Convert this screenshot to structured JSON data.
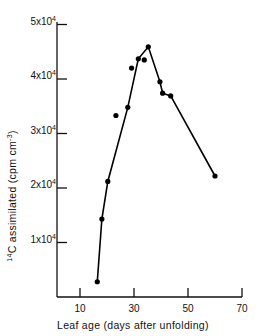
{
  "chart_data": {
    "type": "line",
    "title": "",
    "xlabel": "Leaf age (days after unfolding)",
    "ylabel_prefix": "14",
    "ylabel_main": "C assimilated (cpm cm",
    "ylabel_exp": "-3",
    "ylabel_suffix": ")",
    "ylabel": "14C assimilated (cpm cm-3)",
    "xlim": [
      3,
      70
    ],
    "ylim": [
      0,
      50000
    ],
    "grid": false,
    "legend": null,
    "x_ticks": [
      10,
      30,
      50,
      70
    ],
    "x_tick_labels": [
      "10",
      "30",
      "50",
      "70"
    ],
    "y_ticks": [
      10000,
      20000,
      30000,
      40000,
      50000
    ],
    "y_tick_labels": [
      {
        "mant": "1x10",
        "exp": "4"
      },
      {
        "mant": "2x10",
        "exp": "4"
      },
      {
        "mant": "3x10",
        "exp": "4"
      },
      {
        "mant": "4x10",
        "exp": "4"
      },
      {
        "mant": "5x10",
        "exp": "4"
      }
    ],
    "series": [
      {
        "name": "14C assimilated",
        "marker": "filled-circle",
        "color": "#000000",
        "x": [
          16.4,
          18.1,
          20.3,
          23.3,
          27.7,
          29.1,
          31.6,
          33.8,
          35.3,
          39.6,
          40.6,
          43.6,
          60.0
        ],
        "y": [
          2800,
          14300,
          21200,
          33300,
          34800,
          42000,
          43700,
          43500,
          45900,
          39500,
          37400,
          36900,
          22200
        ],
        "line_path_x": [
          16.4,
          18.1,
          20.3,
          27.7,
          31.6,
          35.3,
          39.6,
          40.6,
          43.6,
          60.0
        ],
        "line_path_y": [
          2800,
          14300,
          21200,
          34800,
          43700,
          45900,
          39500,
          37400,
          36900,
          22200
        ]
      }
    ]
  }
}
